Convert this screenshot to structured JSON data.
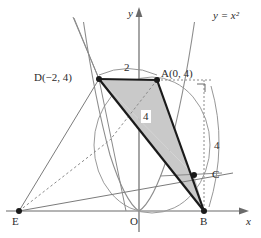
{
  "figure": {
    "title_alt": "Coordinate geometry diagram of parabola y = x squared with quadrilateral DABE",
    "background_color": "#ffffff",
    "stroke_color": "#4a4a4a",
    "bold_stroke_color": "#1a1a1a",
    "shade_color": "#c9c9c9",
    "axes": {
      "x_label": "x",
      "y_label": "y",
      "origin_label": "O"
    },
    "curve": {
      "equation_label": "y = x²",
      "equation_parts": {
        "lhs": "y",
        "eq": "=",
        "rhs_base": "x",
        "rhs_exp": "2"
      }
    },
    "points": [
      {
        "name": "point-D",
        "label": "D(−2, 4)",
        "x": -2,
        "y": 4,
        "px": 99,
        "py": 79
      },
      {
        "name": "point-A",
        "label": "A(0, 4)",
        "x": 0,
        "y": 4,
        "px": 157,
        "py": 80
      },
      {
        "name": "point-C",
        "label": "C",
        "px": 194,
        "py": 175
      },
      {
        "name": "point-B",
        "label": "B",
        "px": 204,
        "py": 211
      },
      {
        "name": "point-E",
        "label": "E",
        "px": 19,
        "py": 211
      },
      {
        "name": "point-O",
        "label": "O",
        "px": 139,
        "py": 211
      }
    ],
    "measures": [
      {
        "name": "measure-DA",
        "value": "2"
      },
      {
        "name": "measure-interior",
        "value": "4"
      },
      {
        "name": "measure-right",
        "value": "4"
      }
    ]
  }
}
